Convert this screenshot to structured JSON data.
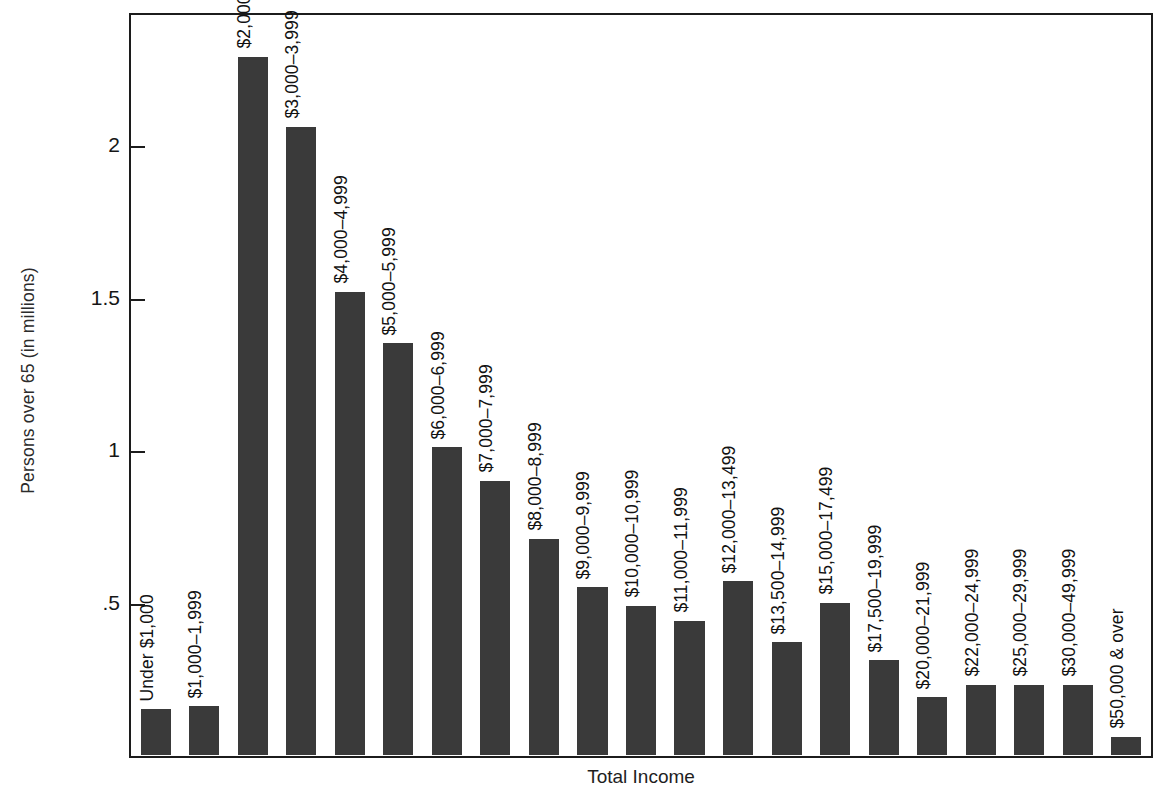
{
  "chart_data": {
    "type": "bar",
    "title": "",
    "xlabel": "Total Income",
    "ylabel": "Persons over 65 (in millions)",
    "ylim": [
      0,
      2.43
    ],
    "grid": false,
    "legend": null,
    "ytick_labels": [
      ".5",
      "1",
      "1.5",
      "2"
    ],
    "ytick_values": [
      0.5,
      1,
      1.5,
      2
    ],
    "categories": [
      "Under $1,000",
      "$1,000–1,999",
      "$2,000–2,999",
      "$3,000–3,999",
      "$4,000–4,999",
      "$5,000–5,999",
      "$6,000–6,999",
      "$7,000–7,999",
      "$8,000–8,999",
      "$9,000–9,999",
      "$10,000–10,999",
      "$11,000–11,999",
      "$12,000–13,499",
      "$13,500–14,999",
      "$15,000–17,499",
      "$17,500–19,999",
      "$20,000–21,999",
      "$22,000–24,999",
      "$25,000–29,999",
      "$30,000–49,999",
      "$50,000 & over"
    ],
    "values": [
      0.15,
      0.16,
      2.29,
      2.06,
      1.52,
      1.35,
      1.01,
      0.9,
      0.71,
      0.55,
      0.49,
      0.44,
      0.57,
      0.37,
      0.5,
      0.31,
      0.19,
      0.23,
      0.23,
      0.23,
      0.06
    ],
    "bar_color": "#3a3a3a",
    "axis_color": "#1c1c1c",
    "background_color": "#ffffff"
  }
}
